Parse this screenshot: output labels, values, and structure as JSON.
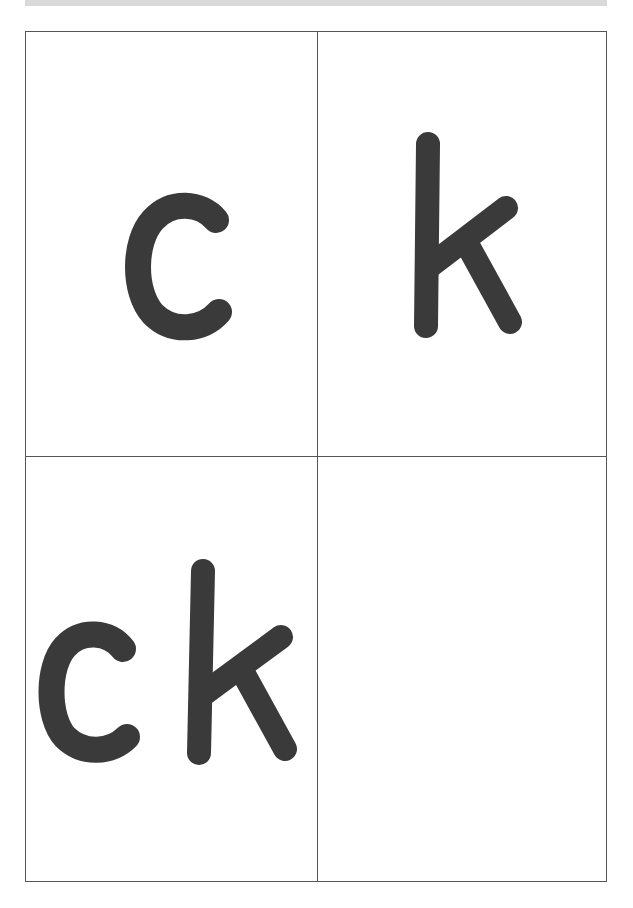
{
  "page": {
    "header_band": "",
    "ink_color": "#3a3a3a",
    "border_color": "#555555"
  },
  "cards": [
    {
      "id": "card-1",
      "text": "c"
    },
    {
      "id": "card-2",
      "text": "k"
    },
    {
      "id": "card-3",
      "text": "ck"
    },
    {
      "id": "card-4",
      "text": ""
    }
  ]
}
